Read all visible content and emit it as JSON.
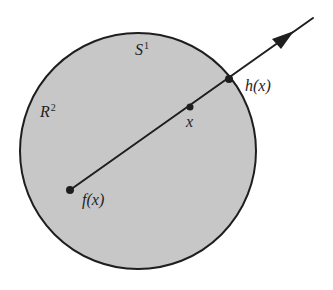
{
  "diagram": {
    "colors": {
      "background": "#ffffff",
      "disk_fill": "#c9c9c9",
      "stroke": "#1e1e1e"
    },
    "disk": {
      "cx": 138,
      "cy": 151,
      "r": 118
    },
    "labels": {
      "boundary_circle": {
        "base": "S",
        "sup": "1"
      },
      "plane": {
        "base": "R",
        "sup": "2"
      },
      "point_x": "x",
      "point_fx": "f(x)",
      "point_hx": "h(x)"
    },
    "points": {
      "f_x": {
        "x": 70,
        "y": 190
      },
      "x": {
        "x": 190,
        "y": 107
      },
      "h_x": {
        "x": 229,
        "y": 79
      }
    },
    "ray": {
      "start": {
        "x": 70,
        "y": 190
      },
      "end": {
        "x": 313,
        "y": 18
      },
      "arrowhead": "filled-triangle",
      "arrow_tip": {
        "x": 292,
        "y": 33
      }
    }
  }
}
